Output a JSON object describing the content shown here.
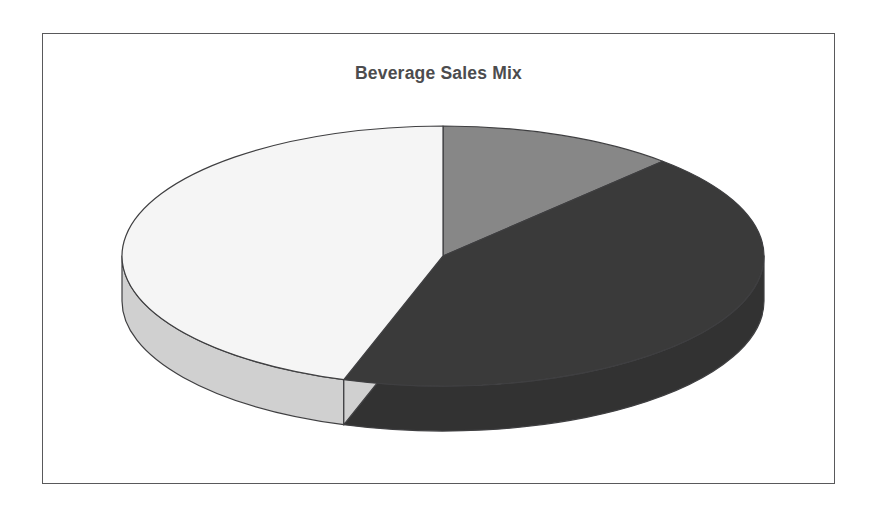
{
  "chart": {
    "title": "Beverage Sales Mix",
    "frame": {
      "border_color": "#59595b",
      "background": "#ffffff"
    },
    "title_color": "#4c4c4e"
  },
  "chart_data": {
    "type": "pie",
    "title": "Beverage Sales Mix",
    "subtitle": "",
    "xlabel": "",
    "ylabel": "",
    "style": "3d-exploded-none",
    "legend": "none",
    "grid": false,
    "start_angle_deg": 0,
    "direction": "clockwise",
    "labels": [
      "Slice 1",
      "Slice 2",
      "Slice 3"
    ],
    "values": [
      12,
      43,
      45
    ],
    "unit": "%",
    "slices": [
      {
        "label": "Slice 1",
        "value": 12,
        "percent": 12,
        "color": "#878787",
        "wall_color": "#6e6e6e",
        "start_deg": 0,
        "end_deg": 43.2
      },
      {
        "label": "Slice 2",
        "value": 43,
        "percent": 43,
        "color": "#3a3a3a",
        "wall_color": "#323232",
        "start_deg": 43.2,
        "end_deg": 198
      },
      {
        "label": "Slice 3",
        "value": 45,
        "percent": 45,
        "color": "#f5f5f5",
        "wall_color": "#d0d0d0",
        "start_deg": 198,
        "end_deg": 360
      }
    ],
    "geometry": {
      "center_x": 400,
      "center_y": 222,
      "radius_x": 321,
      "radius_y": 130,
      "depth": 45
    }
  }
}
